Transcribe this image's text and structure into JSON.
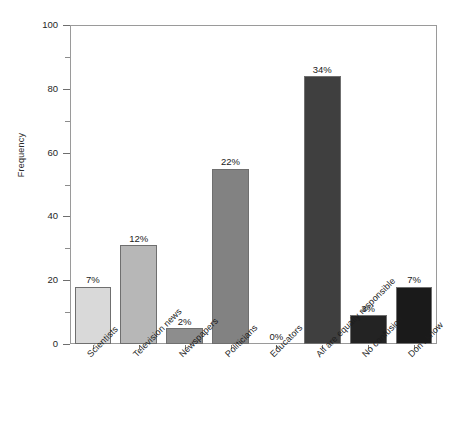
{
  "chart_data": {
    "type": "bar",
    "title": "",
    "xlabel": "",
    "ylabel": "Frequency",
    "ylim": [
      0,
      100
    ],
    "ytick_values": [
      0,
      20,
      40,
      60,
      80,
      100
    ],
    "ytick_labels": [
      "0",
      "20",
      "40",
      "60",
      "80",
      "100"
    ],
    "yminor_values": [
      10,
      30,
      50,
      70,
      90
    ],
    "grid": false,
    "legend": null,
    "categories": [
      "Scientists",
      "Television news",
      "Newspapers",
      "Politicians",
      "Educators",
      "All are equally responsible",
      "No confusion",
      "Don't know"
    ],
    "values": [
      18,
      31,
      5,
      55,
      0,
      84,
      9,
      18
    ],
    "data_labels": [
      "7%",
      "12%",
      "2%",
      "22%",
      "0%",
      "34%",
      "3%",
      "7%"
    ],
    "bar_colors": [
      "#d9d9d9",
      "#b7b7b7",
      "#8d8d8d",
      "#828282",
      "#ffffff",
      "#3f3f3f",
      "#232323",
      "#1a1a1a"
    ]
  }
}
